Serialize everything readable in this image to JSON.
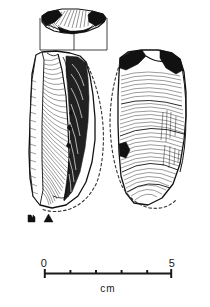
{
  "figure": {
    "kind": "archaeological-lithic-illustration",
    "title": "",
    "background_color": "#ffffff",
    "ink_color": "#111111",
    "views": [
      {
        "name": "cross-section-profile",
        "label": "",
        "position": "top",
        "description": "transverse section profile of the artifact, hatched wedge outline"
      },
      {
        "name": "left-artifact-view",
        "label": "",
        "position": "left",
        "description": "dorsal view of flaked stone core with ripple hatching and dashed reconstructed outline"
      },
      {
        "name": "right-artifact-view",
        "label": "",
        "position": "right",
        "description": "ventral view of flaked stone core with ripple hatching and dashed reconstructed outline"
      }
    ],
    "orientation_marks": [
      {
        "name": "section-marker-square",
        "glyph": "square"
      },
      {
        "name": "section-marker-triangle",
        "glyph": "triangle"
      }
    ],
    "scale_bar": {
      "name": "scale-bar",
      "start_label": "0",
      "end_label": "5",
      "unit_label": "cm",
      "min": 0,
      "max": 5,
      "tick_count": 6,
      "tick_values": [
        0,
        1,
        2,
        3,
        4,
        5
      ],
      "bar_color": "#1a1a1a",
      "x_start_px": 44,
      "x_end_px": 172,
      "y_px": 273
    }
  }
}
